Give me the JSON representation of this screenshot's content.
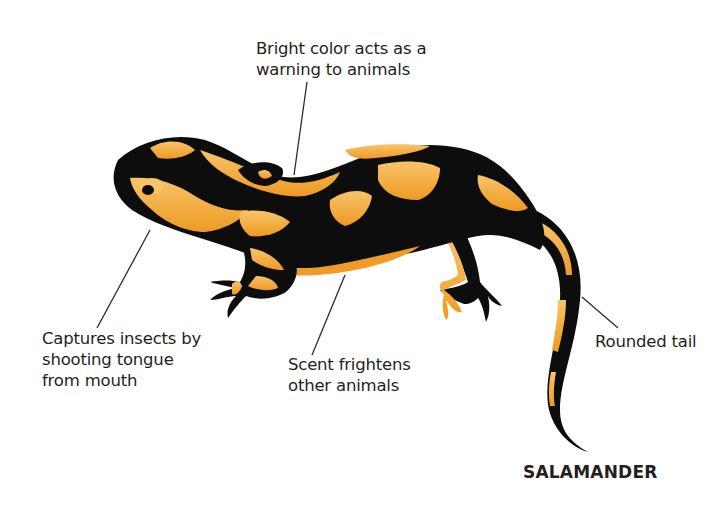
{
  "diagram": {
    "title": "SALAMANDER",
    "colors": {
      "body_black": "#0d0d0d",
      "body_orange": "#f4a535",
      "orange_highlight": "#f8c46a",
      "leader_line": "#2b2b2b",
      "text": "#231f20",
      "background": "#ffffff"
    },
    "callouts": [
      {
        "id": "warning-color",
        "lines": [
          "Bright color acts as a",
          "warning to animals"
        ]
      },
      {
        "id": "tongue",
        "lines": [
          "Captures insects by",
          "shooting tongue",
          "from mouth"
        ]
      },
      {
        "id": "scent",
        "lines": [
          "Scent frightens",
          "other animals"
        ]
      },
      {
        "id": "tail",
        "lines": [
          "Rounded tail"
        ]
      }
    ]
  }
}
